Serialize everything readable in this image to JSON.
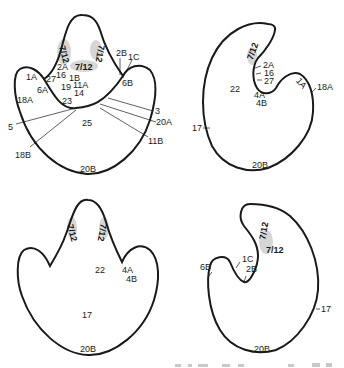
{
  "figure": {
    "panels": [
      {
        "id": "top-left",
        "description": "front view, heart-like outline with labelled regions",
        "labels": {
          "l_2B": "2B",
          "l_1C": "1C",
          "l_6B": "6B",
          "l_1A": "1A",
          "l_2A": "2A",
          "l_16": "16",
          "l_27": "27",
          "l_1B": "1B",
          "l_19": "19",
          "l_11A": "11A",
          "l_14": "14",
          "l_6A": "6A",
          "l_18A": "18A",
          "l_23": "23",
          "l_3": "3",
          "l_20A": "20A",
          "l_5": "5",
          "l_25": "25",
          "l_11B": "11B",
          "l_18B": "18B",
          "l_20B": "20B",
          "shade_left": "7/12",
          "shade_center": "7/12",
          "shade_right": "7/12"
        }
      },
      {
        "id": "top-right",
        "description": "side view, kidney-like outline",
        "labels": {
          "shade": "7/12",
          "l_2A": "2A",
          "l_16": "16",
          "l_27": "27",
          "l_22": "22",
          "l_4A": "4A",
          "l_4B": "4B",
          "l_1A": "1A",
          "l_18A": "18A",
          "l_17": "17",
          "l_20B": "20B"
        }
      },
      {
        "id": "bottom-left",
        "description": "back view, heart-like outline",
        "labels": {
          "shade_left": "7/12",
          "shade_right": "7/12",
          "l_22": "22",
          "l_4A": "4A",
          "l_4B": "4B",
          "l_17": "17",
          "l_20B": "20B"
        }
      },
      {
        "id": "bottom-right",
        "description": "opposite side view, mirrored kidney-like outline",
        "labels": {
          "shade_top": "7/12",
          "shade_bottom": "7/12",
          "l_6B": "6B",
          "l_1C": "1C",
          "l_2B": "2B",
          "l_17": "17",
          "l_20B": "20B"
        }
      }
    ],
    "caption_partial": "… (caption cut off at bottom edge, illegible)"
  },
  "colors": {
    "ink": "#1a1a1a",
    "shade": "#c8c8c8",
    "background": "#ffffff"
  }
}
